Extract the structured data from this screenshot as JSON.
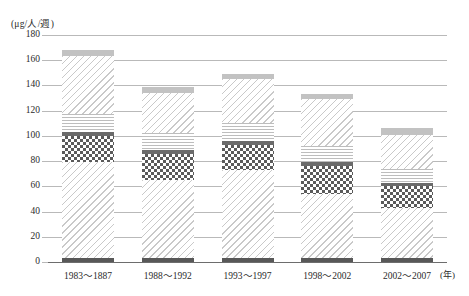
{
  "chart_data": {
    "type": "bar",
    "title": "",
    "subtitle": "",
    "xlabel": "年",
    "ylabel": "(μg/人/週)",
    "unit_label": "(μg/人/週)",
    "x_axis_unit": "(年)",
    "categories": [
      "1983～1887",
      "1988～1992",
      "1993～1997",
      "1998～2002",
      "2002～2007"
    ],
    "ylim": [
      0,
      180
    ],
    "ytick_labels": [
      "180",
      "160",
      "140",
      "120",
      "100",
      "80",
      "60",
      "40",
      "20",
      "0"
    ],
    "ytick_values": [
      180,
      160,
      140,
      120,
      100,
      80,
      60,
      40,
      20,
      0
    ],
    "grid": true,
    "legend": "none",
    "stacked": true,
    "totals": [
      168,
      139,
      149,
      133,
      106
    ],
    "series": [
      {
        "name": "base-band",
        "pattern": "solid-dark",
        "color": "#585858",
        "values": [
          3,
          3,
          3,
          3,
          3
        ]
      },
      {
        "name": "lower-diagonal",
        "pattern": "diagonal-hatch",
        "color": "#c9c9c9",
        "values": [
          76,
          62,
          70,
          51,
          40
        ]
      },
      {
        "name": "checkerboard",
        "pattern": "checkerboard",
        "color": "#5a5a5a",
        "values": [
          21,
          21,
          20,
          22,
          17
        ]
      },
      {
        "name": "dark-separator",
        "pattern": "solid-dark",
        "color": "#6b6b6b",
        "values": [
          3,
          3,
          3,
          3,
          3
        ]
      },
      {
        "name": "horizontal-lines",
        "pattern": "horizontal-hatch",
        "color": "#bdbdbd",
        "values": [
          14,
          13,
          14,
          13,
          11
        ]
      },
      {
        "name": "upper-diagonal",
        "pattern": "diagonal-hatch",
        "color": "#c9c9c9",
        "values": [
          46,
          32,
          35,
          37,
          27
        ]
      },
      {
        "name": "top-cap",
        "pattern": "solid-gray",
        "color": "#c2c2c2",
        "values": [
          5,
          5,
          4,
          4,
          5
        ]
      }
    ]
  }
}
